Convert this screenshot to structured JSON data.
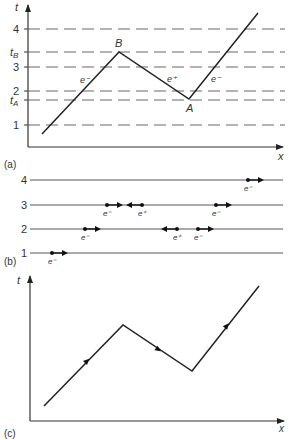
{
  "panel_a": {
    "label": "(a)",
    "t_axis_label": "t",
    "x_axis_label": "x",
    "ticks": [
      {
        "label": "4",
        "y": 29
      },
      {
        "label": "t_B",
        "main": "t",
        "sub": "B",
        "y": 52
      },
      {
        "label": "3",
        "y": 67
      },
      {
        "label": "2",
        "y": 91
      },
      {
        "label": "t_A",
        "main": "t",
        "sub": "A",
        "y": 100
      },
      {
        "label": "1",
        "y": 125
      }
    ],
    "points": {
      "B": "B",
      "A": "A"
    },
    "segment_labels": {
      "seg1": "e⁻",
      "seg2": "e⁺",
      "seg3": "e⁻"
    }
  },
  "panel_b": {
    "label": "(b)",
    "lines": [
      {
        "t": "4",
        "particles": [
          {
            "type": "e⁻",
            "dir": "right"
          }
        ]
      },
      {
        "t": "3",
        "particles": [
          {
            "type": "e⁻",
            "dir": "right"
          },
          {
            "type": "e⁺",
            "dir": "left"
          },
          {
            "type": "e⁻",
            "dir": "right"
          }
        ]
      },
      {
        "t": "2",
        "particles": [
          {
            "type": "e⁻",
            "dir": "right"
          },
          {
            "type": "e⁺",
            "dir": "left"
          },
          {
            "type": "e⁻",
            "dir": "right"
          }
        ]
      },
      {
        "t": "1",
        "particles": [
          {
            "type": "e⁻",
            "dir": "right"
          }
        ]
      }
    ]
  },
  "panel_c": {
    "label": "(c)",
    "t_axis_label": "t",
    "x_axis_label": "x"
  }
}
